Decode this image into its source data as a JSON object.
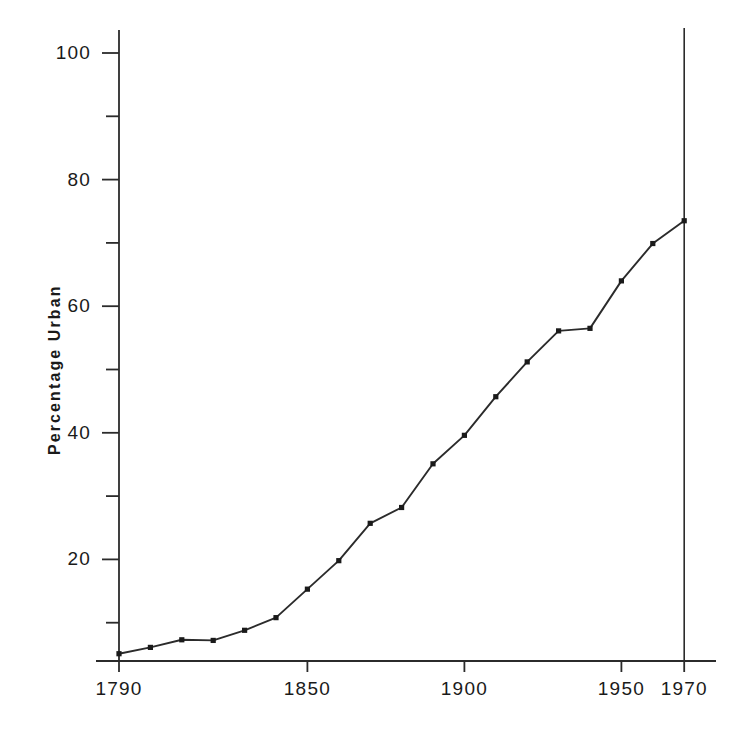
{
  "chart_data": {
    "type": "line",
    "title": "",
    "subtitle": "",
    "xlabel": "",
    "ylabel": "Percentage Urban",
    "x": [
      1790,
      1800,
      1810,
      1820,
      1830,
      1840,
      1850,
      1860,
      1870,
      1880,
      1890,
      1900,
      1910,
      1920,
      1930,
      1940,
      1950,
      1960,
      1970
    ],
    "values": [
      5.1,
      6.1,
      7.3,
      7.2,
      8.8,
      10.8,
      15.3,
      19.8,
      25.7,
      28.2,
      35.1,
      39.6,
      45.7,
      51.2,
      56.1,
      56.5,
      64.0,
      69.9,
      73.5
    ],
    "series": [
      {
        "name": "Percentage Urban",
        "values": [
          5.1,
          6.1,
          7.3,
          7.2,
          8.8,
          10.8,
          15.3,
          19.8,
          25.7,
          28.2,
          35.1,
          39.6,
          45.7,
          51.2,
          56.1,
          56.5,
          64.0,
          69.9,
          73.5
        ]
      }
    ],
    "xlim": [
      1790,
      1970
    ],
    "ylim": [
      0,
      103
    ],
    "xticks_major": [
      1790,
      1850,
      1900,
      1950,
      1970
    ],
    "xtick_labels": [
      "1790",
      "1850",
      "1900",
      "1950",
      "1970"
    ],
    "yticks_major": [
      20,
      40,
      60,
      80,
      100
    ],
    "ytick_labels": [
      "20",
      "40",
      "60",
      "80",
      "100"
    ],
    "yticks_minor": [
      10,
      30,
      50,
      70,
      90
    ],
    "grid": false,
    "legend": "none",
    "marker": "square-dot",
    "line_color": "#2b2b2b",
    "marker_color": "#1a1a1a",
    "axis_color": "#2b2b2b",
    "background_color": "#ffffff",
    "annotations": [
      {
        "name": "year-1970-vertical-rule",
        "type": "vline",
        "x": 1970,
        "label": ""
      }
    ]
  },
  "geometry": {
    "plot_left": 119,
    "plot_right": 716,
    "plot_bottom": 661,
    "axis_top": 30,
    "y_100_px": 53,
    "y_per_unit": 6.33,
    "x_left_year": 1790,
    "x_left_px": 119,
    "x_px_per_year": 3.14,
    "vline_top": 28
  }
}
